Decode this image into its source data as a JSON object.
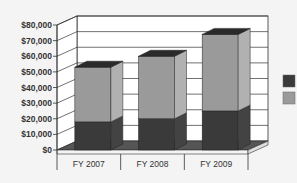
{
  "chart_data": {
    "type": "bar",
    "stacked": true,
    "three_d": true,
    "title": "",
    "xlabel": "",
    "ylabel": "",
    "categories": [
      "FY 2007",
      "FY 2008",
      "FY 2009"
    ],
    "series": [
      {
        "name": "",
        "color": "#3a3a3a",
        "values": [
          18000,
          20000,
          25000
        ]
      },
      {
        "name": "",
        "color": "#9a9a9a",
        "values": [
          35000,
          40000,
          49000
        ]
      }
    ],
    "ylim": [
      0,
      80000
    ],
    "y_ticks": [
      "$0",
      "$10,000",
      "$20,000",
      "$30,000",
      "$40,000",
      "$50,000",
      "$60,000",
      "$70,000",
      "$80,000"
    ],
    "grid": true,
    "legend_position": "right"
  }
}
